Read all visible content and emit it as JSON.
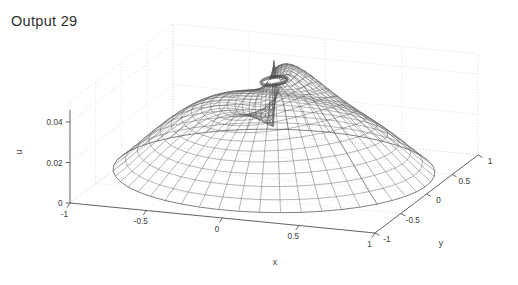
{
  "title": "Output 29",
  "figure": {
    "background": "#ffffff",
    "axis_color": "#4a4a4a",
    "grid_color": "#cfcfcf",
    "mesh_color": "#555555",
    "text_color": "#3a3a3a"
  },
  "chart_data": {
    "type": "surface",
    "title": "Output 29",
    "xlabel": "x",
    "ylabel": "y",
    "zlabel": "u",
    "xlim": [
      -1,
      1
    ],
    "ylim": [
      -1,
      1
    ],
    "zlim": [
      0,
      0.05
    ],
    "xticks": [
      "-1",
      "-0.5",
      "0",
      "0.5",
      "1"
    ],
    "xtick_values": [
      -1,
      -0.5,
      0,
      0.5,
      1
    ],
    "yticks": [
      "-1",
      "-0.5",
      "0",
      "0.5",
      "1"
    ],
    "ytick_values": [
      -1,
      -0.5,
      0,
      0.5,
      1
    ],
    "zticks": [
      "0",
      "0.02",
      "0.04"
    ],
    "ztick_values": [
      0,
      0.02,
      0.04
    ],
    "grid": true,
    "grid_style": "dotted",
    "legend": null,
    "domain": "unit disk (polar mesh)",
    "mesh": {
      "radial_divisions": 20,
      "angular_divisions": 48,
      "style": "wireframe",
      "description": "Dome-shaped solution u(r,theta) on the unit disk with a spiral branch-cut singularity at the origin; peak value approximately 0.045 near the centre, falling to about 0.004 at the rim."
    },
    "peak_value": 0.045,
    "rim_value": 0.004,
    "view": {
      "azimuth": -37.5,
      "elevation": 18
    }
  }
}
